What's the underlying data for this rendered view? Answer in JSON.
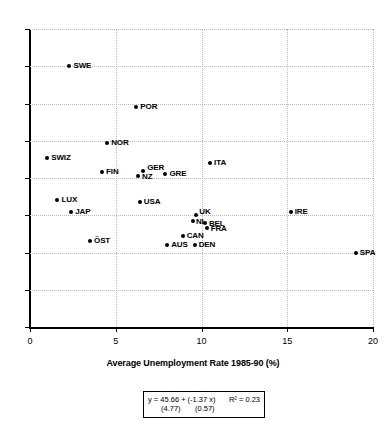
{
  "chart_data": {
    "type": "scatter",
    "title": "",
    "xlabel": "Average Unemployment Rate 1985-90 (%)",
    "ylabel": "",
    "xlim": [
      0,
      20
    ],
    "ylim": [
      0,
      80
    ],
    "xticks": [
      "0",
      "5",
      "10",
      "15",
      "20"
    ],
    "yticks": [
      "0",
      "10",
      "20",
      "30",
      "40",
      "50",
      "60",
      "70",
      "80"
    ],
    "grid": true,
    "legend": "none",
    "points": [
      {
        "label": "SWE",
        "x": 2.3,
        "y": 70.0,
        "lx": 4,
        "ly": -4
      },
      {
        "label": "POR",
        "x": 6.2,
        "y": 59.0,
        "lx": 4,
        "ly": -4
      },
      {
        "label": "NOR",
        "x": 4.5,
        "y": 49.5,
        "lx": 4,
        "ly": -4
      },
      {
        "label": "SWIZ",
        "x": 1.0,
        "y": 45.5,
        "lx": 4,
        "ly": -4
      },
      {
        "label": "FIN",
        "x": 4.2,
        "y": 41.5,
        "lx": 4,
        "ly": -4
      },
      {
        "label": "NZ",
        "x": 6.3,
        "y": 40.5,
        "lx": 4,
        "ly": -3
      },
      {
        "label": "GER",
        "x": 6.6,
        "y": 42.0,
        "lx": 4,
        "ly": -7
      },
      {
        "label": "GRE",
        "x": 7.9,
        "y": 41.0,
        "lx": 4,
        "ly": -4
      },
      {
        "label": "ITA",
        "x": 10.5,
        "y": 44.0,
        "lx": 4,
        "ly": -4
      },
      {
        "label": "LUX",
        "x": 1.6,
        "y": 34.0,
        "lx": 4,
        "ly": -4
      },
      {
        "label": "JAP",
        "x": 2.4,
        "y": 31.0,
        "lx": 4,
        "ly": -4
      },
      {
        "label": "USA",
        "x": 6.4,
        "y": 33.5,
        "lx": 4,
        "ly": -4
      },
      {
        "label": "UK",
        "x": 9.7,
        "y": 30.0,
        "lx": 3,
        "ly": -7
      },
      {
        "label": "NL",
        "x": 9.5,
        "y": 28.5,
        "lx": 3,
        "ly": -3
      },
      {
        "label": "BEL",
        "x": 10.2,
        "y": 28.0,
        "lx": 4,
        "ly": -3
      },
      {
        "label": "FRA",
        "x": 10.3,
        "y": 26.5,
        "lx": 4,
        "ly": -3
      },
      {
        "label": "IRE",
        "x": 15.2,
        "y": 31.0,
        "lx": 4,
        "ly": -4
      },
      {
        "label": "CAN",
        "x": 8.9,
        "y": 24.5,
        "lx": 4,
        "ly": -4
      },
      {
        "label": "DEN",
        "x": 9.6,
        "y": 22.0,
        "lx": 4,
        "ly": -4
      },
      {
        "label": "AUS",
        "x": 8.0,
        "y": 22.0,
        "lx": 4,
        "ly": -4
      },
      {
        "label": "ÖST",
        "x": 3.5,
        "y": 23.0,
        "lx": 4,
        "ly": -4
      },
      {
        "label": "SPA",
        "x": 19.0,
        "y": 20.0,
        "lx": 4,
        "ly": -4
      }
    ]
  },
  "regression": {
    "equation": "y = 45.66 + (-1.37 x)",
    "r_squared": "R² = 0.23",
    "se_intercept": "(4.77)",
    "se_slope": "(0.57)"
  }
}
